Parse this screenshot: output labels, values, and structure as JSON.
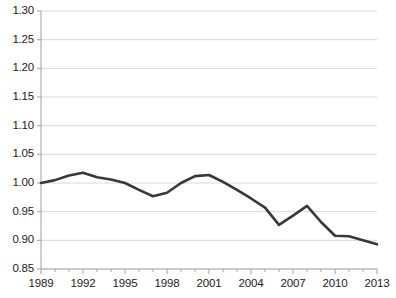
{
  "chart_data": {
    "type": "line",
    "title": "",
    "subtitle": "",
    "xlabel": "",
    "ylabel": "",
    "xlim": [
      1989,
      2013
    ],
    "ylim": [
      0.85,
      1.3
    ],
    "grid": true,
    "legend": null,
    "legend_position": "none",
    "y_ticks": [
      "1.30",
      "1.25",
      "1.20",
      "1.15",
      "1.10",
      "1.05",
      "1.00",
      "0.95",
      "0.90",
      "0.85"
    ],
    "y_tick_values": [
      1.3,
      1.25,
      1.2,
      1.15,
      1.1,
      1.05,
      1.0,
      0.95,
      0.9,
      0.85
    ],
    "x_ticks": [
      "1989",
      "1992",
      "1995",
      "1998",
      "2001",
      "2004",
      "2007",
      "2010",
      "2013"
    ],
    "x_tick_values": [
      1989,
      1992,
      1995,
      1998,
      2001,
      2004,
      2007,
      2010,
      2013
    ],
    "x_minor_step": 1,
    "x": [
      1989,
      1990,
      1991,
      1992,
      1993,
      1994,
      1995,
      1996,
      1997,
      1998,
      1999,
      2000,
      2001,
      2002,
      2003,
      2004,
      2005,
      2006,
      2007,
      2008,
      2009,
      2010,
      2011,
      2012,
      2013
    ],
    "series": [
      {
        "name": "index",
        "color": "#383838",
        "line_width": 2.6,
        "values": [
          1.0,
          1.005,
          1.013,
          1.018,
          1.01,
          1.006,
          1.0,
          0.988,
          0.977,
          0.983,
          1.0,
          1.012,
          1.014,
          1.002,
          0.988,
          0.973,
          0.957,
          0.927,
          0.943,
          0.96,
          0.932,
          0.908,
          0.907,
          0.9,
          0.893
        ]
      }
    ],
    "colors": {
      "line": "#383838",
      "grid": "#d8d8d8",
      "axis": "#a8a8a8",
      "tick_text": "#1b1b1b",
      "background": "#ffffff"
    }
  }
}
